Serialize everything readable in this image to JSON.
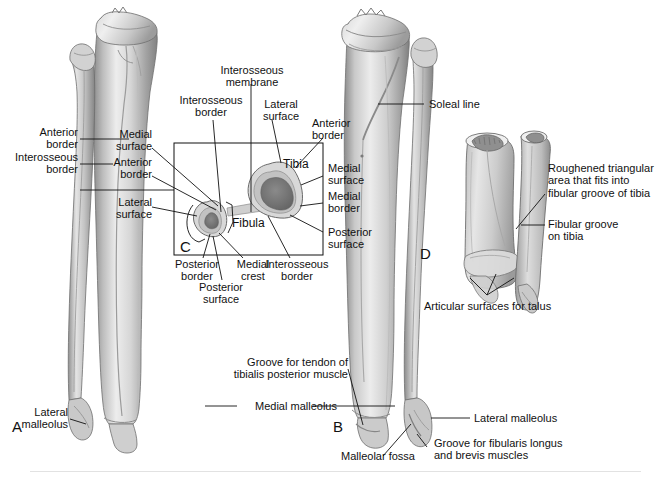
{
  "figure": {
    "panels": [
      {
        "letter": "A",
        "name": "anterior-view"
      },
      {
        "letter": "B",
        "name": "posterior-view"
      },
      {
        "letter": "C",
        "name": "cross-section"
      },
      {
        "letter": "D",
        "name": "distal-tibiofibular-joint"
      }
    ]
  },
  "colors": {
    "bone_light": "#e8e8e8",
    "bone_mid": "#c6c6c6",
    "bone_dark": "#9a9a9a",
    "bone_shadow": "#7d7d7d",
    "marrow": "#7a7a7a",
    "cortex": "#d5d5d5",
    "leader": "#111111",
    "text": "#111111",
    "footer_rule": "#e2e2e2"
  },
  "panel_a": {
    "letter": "A",
    "labels": [
      {
        "text": "Anterior\nborder",
        "name": "label-anterior-border"
      },
      {
        "text": "Interosseous\nborder",
        "name": "label-interosseous-border"
      },
      {
        "text": "Lateral\nmalleolus",
        "name": "label-lateral-malleolus"
      }
    ]
  },
  "panel_b": {
    "letter": "B",
    "labels": [
      {
        "text": "Soleal line",
        "name": "label-soleal-line"
      },
      {
        "text": "Groove for tendon of\ntibialis posterior muscle",
        "name": "label-groove-tibialis-posterior"
      },
      {
        "text": "Medial malleolus",
        "name": "label-medial-malleolus"
      },
      {
        "text": "Lateral malleolus",
        "name": "label-lateral-malleolus-b"
      },
      {
        "text": "Malleolar fossa",
        "name": "label-malleolar-fossa"
      },
      {
        "text": "Groove for fibularis longus\nand brevis muscles",
        "name": "label-groove-fibularis"
      }
    ]
  },
  "panel_c": {
    "letter": "C",
    "bone_labels": [
      {
        "text": "Tibia",
        "name": "label-tibia"
      },
      {
        "text": "Fibula",
        "name": "label-fibula"
      }
    ],
    "labels_top": [
      {
        "text": "Interosseous\nmembrane",
        "name": "label-interosseous-membrane"
      },
      {
        "text": "Interosseous\nborder",
        "name": "label-interosseous-border-top"
      },
      {
        "text": "Lateral\nsurface",
        "name": "label-lateral-surface-top"
      },
      {
        "text": "Anterior\nborder",
        "name": "label-anterior-border-right"
      }
    ],
    "labels_left": [
      {
        "text": "Medial\nsurface",
        "name": "label-medial-surface-left"
      },
      {
        "text": "Anterior\nborder",
        "name": "label-anterior-border-left"
      },
      {
        "text": "Lateral\nsurface",
        "name": "label-lateral-surface-left"
      }
    ],
    "labels_right": [
      {
        "text": "Medial\nsurface",
        "name": "label-medial-surface-right"
      },
      {
        "text": "Medial\nborder",
        "name": "label-medial-border-right"
      },
      {
        "text": "Posterior\nsurface",
        "name": "label-posterior-surface-right"
      }
    ],
    "labels_bottom": [
      {
        "text": "Posterior\nborder",
        "name": "label-posterior-border"
      },
      {
        "text": "Posterior\nsurface",
        "name": "label-posterior-surface-bottom"
      },
      {
        "text": "Medial\ncrest",
        "name": "label-medial-crest"
      },
      {
        "text": "Interosseous\nborder",
        "name": "label-interosseous-border-bottom"
      }
    ]
  },
  "panel_d": {
    "letter": "D",
    "labels": [
      {
        "text": "Roughened triangular\narea that fits into\nfibular groove of tibia",
        "name": "label-roughened-triangular-area"
      },
      {
        "text": "Fibular groove\non tibia",
        "name": "label-fibular-groove-on-tibia"
      },
      {
        "text": "Articular surfaces for talus",
        "name": "label-articular-surfaces-for-talus"
      }
    ]
  }
}
